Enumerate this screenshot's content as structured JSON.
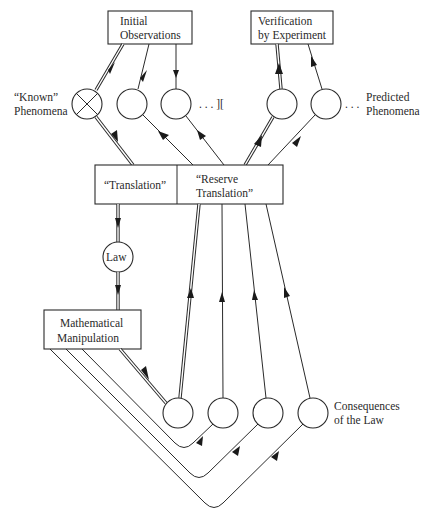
{
  "diagram": {
    "boxes": {
      "initial_observations": {
        "line1": "Initial",
        "line2": "Observations"
      },
      "verification": {
        "line1": "Verification",
        "line2": "by Experiment"
      },
      "translation": {
        "label": "“Translation”"
      },
      "reserve_translation": {
        "line1": "“Reserve",
        "line2": "Translation”"
      },
      "mathematical_manipulation": {
        "line1": "Mathematical",
        "line2": "Manipulation"
      }
    },
    "nodes": {
      "law": {
        "label": "Law"
      }
    },
    "labels": {
      "known_phenomena": {
        "line1": "“Known”",
        "line2": "Phenomena"
      },
      "predicted_phenomena": {
        "line1": "Predicted",
        "line2": "Phenomena"
      },
      "consequences": {
        "line1": "Consequences",
        "line2": "of the Law"
      },
      "ellipsis_left": ". . . ][",
      "ellipsis_right": ". . ."
    },
    "colors": {
      "stroke": "#2a2a2a",
      "background": "#ffffff"
    }
  }
}
